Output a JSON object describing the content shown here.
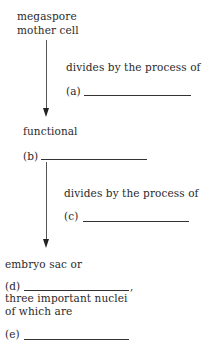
{
  "diagram": {
    "type": "flowchart",
    "nodes": [
      {
        "id": "start",
        "lines": [
          "megaspore",
          "mother cell"
        ]
      },
      {
        "id": "step1",
        "label": "divides by the process of",
        "blank_label": "(a)"
      },
      {
        "id": "node_b",
        "prefix": "functional",
        "blank_label": "(b)"
      },
      {
        "id": "step2",
        "label": "divides by the process of",
        "blank_label": "(c)"
      },
      {
        "id": "node_d",
        "prefix": "embryo sac or",
        "blank_label": "(d)",
        "suffix": ",",
        "lines": [
          "three important nuclei",
          "of which are"
        ]
      },
      {
        "id": "node_e",
        "blank_label": "(e)"
      }
    ],
    "edges": [
      {
        "from": "start",
        "to": "node_b",
        "annotation": "step1"
      },
      {
        "from": "node_b",
        "to": "node_d",
        "annotation": "step2"
      }
    ]
  },
  "text": {
    "start_line1": "megaspore",
    "start_line2": "mother cell",
    "process1": "divides by the process of",
    "a_label": "(a)",
    "functional": "functional",
    "b_label": "(b)",
    "process2": "divides by the process of",
    "c_label": "(c)",
    "embryo": "embryo sac or",
    "d_label": "(d)",
    "comma": ",",
    "nuclei_line1": "three important nuclei",
    "nuclei_line2": "of which are",
    "e_label": "(e)"
  }
}
